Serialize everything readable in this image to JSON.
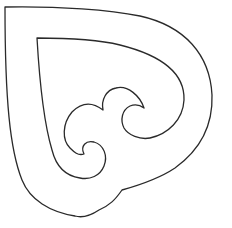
{
  "figure": {
    "description": "Line-art outline of a heart-like shape with inner koru spiral motifs",
    "background": "#ffffff",
    "stroke_color": "#2a2a2a"
  }
}
